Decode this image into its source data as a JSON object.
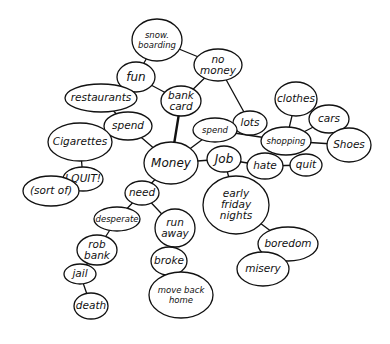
{
  "diagram": {
    "type": "mind-map",
    "style": "hand-drawn",
    "center_node": "money",
    "colors": {
      "ink": "#111111",
      "background": "#ffffff"
    },
    "nodes": [
      {
        "id": "money",
        "lines": [
          "Money"
        ],
        "cx": 171,
        "cy": 163,
        "rx": 27,
        "ry": 21,
        "size": "big"
      },
      {
        "id": "bank-card",
        "lines": [
          "bank",
          "card"
        ],
        "cx": 181,
        "cy": 101,
        "rx": 20,
        "ry": 15
      },
      {
        "id": "fun",
        "lines": [
          "fun"
        ],
        "cx": 136,
        "cy": 77,
        "rx": 19,
        "ry": 15,
        "size": "big"
      },
      {
        "id": "snowboarding",
        "lines": [
          "snow.",
          "boarding"
        ],
        "cx": 157,
        "cy": 40,
        "rx": 25,
        "ry": 21,
        "size": "small"
      },
      {
        "id": "no-money",
        "lines": [
          "no",
          "money"
        ],
        "cx": 218,
        "cy": 65,
        "rx": 24,
        "ry": 16
      },
      {
        "id": "lots",
        "lines": [
          "lots"
        ],
        "cx": 250,
        "cy": 123,
        "rx": 17,
        "ry": 12
      },
      {
        "id": "spend-left",
        "lines": [
          "spend"
        ],
        "cx": 128,
        "cy": 126,
        "rx": 24,
        "ry": 14
      },
      {
        "id": "restaurants",
        "lines": [
          "restaurants"
        ],
        "cx": 101,
        "cy": 98,
        "rx": 36,
        "ry": 14
      },
      {
        "id": "cigarettes",
        "lines": [
          "Cigarettes"
        ],
        "cx": 80,
        "cy": 142,
        "rx": 32,
        "ry": 19
      },
      {
        "id": "i-quit",
        "lines": [
          "I QUIT!"
        ],
        "cx": 83,
        "cy": 179,
        "rx": 20,
        "ry": 12
      },
      {
        "id": "sort-of",
        "lines": [
          "(sort of)"
        ],
        "cx": 51,
        "cy": 191,
        "rx": 28,
        "ry": 15
      },
      {
        "id": "spend-right",
        "lines": [
          "spend"
        ],
        "cx": 215,
        "cy": 130,
        "rx": 22,
        "ry": 12,
        "size": "small"
      },
      {
        "id": "shopping",
        "lines": [
          "shopping"
        ],
        "cx": 286,
        "cy": 141,
        "rx": 25,
        "ry": 14,
        "size": "small"
      },
      {
        "id": "clothes",
        "lines": [
          "clothes"
        ],
        "cx": 296,
        "cy": 99,
        "rx": 21,
        "ry": 17
      },
      {
        "id": "cars",
        "lines": [
          "cars"
        ],
        "cx": 329,
        "cy": 119,
        "rx": 20,
        "ry": 14
      },
      {
        "id": "shoes",
        "lines": [
          "Shoes"
        ],
        "cx": 349,
        "cy": 145,
        "rx": 22,
        "ry": 17
      },
      {
        "id": "job",
        "lines": [
          "Job"
        ],
        "cx": 224,
        "cy": 159,
        "rx": 17,
        "ry": 13,
        "size": "big"
      },
      {
        "id": "hate",
        "lines": [
          "hate"
        ],
        "cx": 265,
        "cy": 166,
        "rx": 18,
        "ry": 13
      },
      {
        "id": "quit",
        "lines": [
          "quit"
        ],
        "cx": 306,
        "cy": 165,
        "rx": 16,
        "ry": 11
      },
      {
        "id": "early-friday-nights",
        "lines": [
          "early",
          "friday",
          "nights"
        ],
        "cx": 236,
        "cy": 205,
        "rx": 33,
        "ry": 29
      },
      {
        "id": "boredom",
        "lines": [
          "boredom"
        ],
        "cx": 288,
        "cy": 244,
        "rx": 30,
        "ry": 17
      },
      {
        "id": "misery",
        "lines": [
          "misery"
        ],
        "cx": 263,
        "cy": 269,
        "rx": 26,
        "ry": 17
      },
      {
        "id": "need",
        "lines": [
          "need"
        ],
        "cx": 142,
        "cy": 193,
        "rx": 17,
        "ry": 12
      },
      {
        "id": "desperate",
        "lines": [
          "desperate"
        ],
        "cx": 117,
        "cy": 219,
        "rx": 23,
        "ry": 12,
        "size": "small"
      },
      {
        "id": "rob-bank",
        "lines": [
          "rob",
          "bank"
        ],
        "cx": 97,
        "cy": 250,
        "rx": 20,
        "ry": 15
      },
      {
        "id": "jail",
        "lines": [
          "jail"
        ],
        "cx": 80,
        "cy": 274,
        "rx": 16,
        "ry": 10
      },
      {
        "id": "death",
        "lines": [
          "death"
        ],
        "cx": 91,
        "cy": 306,
        "rx": 17,
        "ry": 13
      },
      {
        "id": "run-away",
        "lines": [
          "run",
          "away"
        ],
        "cx": 175,
        "cy": 228,
        "rx": 20,
        "ry": 19
      },
      {
        "id": "broke",
        "lines": [
          "broke"
        ],
        "cx": 169,
        "cy": 261,
        "rx": 18,
        "ry": 14
      },
      {
        "id": "move-back-home",
        "lines": [
          "move back",
          "home"
        ],
        "cx": 181,
        "cy": 295,
        "rx": 32,
        "ry": 23,
        "size": "small"
      }
    ],
    "edges": [
      {
        "from": "money",
        "to": "bank-card",
        "thick": true
      },
      {
        "from": "bank-card",
        "to": "fun"
      },
      {
        "from": "bank-card",
        "to": "no-money"
      },
      {
        "from": "fun",
        "to": "snowboarding"
      },
      {
        "from": "snowboarding",
        "to": "no-money"
      },
      {
        "from": "no-money",
        "to": "lots"
      },
      {
        "from": "lots",
        "to": "spend-right"
      },
      {
        "from": "money",
        "to": "spend-left"
      },
      {
        "from": "spend-left",
        "to": "restaurants"
      },
      {
        "from": "spend-left",
        "to": "cigarettes"
      },
      {
        "from": "cigarettes",
        "to": "i-quit"
      },
      {
        "from": "i-quit",
        "to": "sort-of"
      },
      {
        "from": "money",
        "to": "spend-right"
      },
      {
        "from": "spend-right",
        "to": "shopping"
      },
      {
        "from": "shopping",
        "to": "clothes"
      },
      {
        "from": "shopping",
        "to": "cars"
      },
      {
        "from": "shopping",
        "to": "shoes"
      },
      {
        "from": "money",
        "to": "job"
      },
      {
        "from": "job",
        "to": "hate"
      },
      {
        "from": "hate",
        "to": "quit"
      },
      {
        "from": "job",
        "to": "early-friday-nights"
      },
      {
        "from": "early-friday-nights",
        "to": "boredom"
      },
      {
        "from": "boredom",
        "to": "misery"
      },
      {
        "from": "money",
        "to": "need"
      },
      {
        "from": "need",
        "to": "desperate"
      },
      {
        "from": "need",
        "to": "run-away"
      },
      {
        "from": "desperate",
        "to": "rob-bank"
      },
      {
        "from": "rob-bank",
        "to": "jail"
      },
      {
        "from": "jail",
        "to": "death"
      },
      {
        "from": "run-away",
        "to": "broke"
      },
      {
        "from": "broke",
        "to": "move-back-home"
      }
    ]
  }
}
